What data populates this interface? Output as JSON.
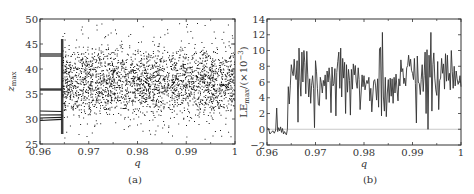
{
  "chart_data": [
    {
      "id": "a",
      "type": "scatter",
      "caption": "(a)",
      "title": "",
      "xlabel": "q",
      "ylabel": "z_max",
      "ylabel_main": "z",
      "ylabel_sub": "max",
      "xlim": [
        0.96,
        1.0
      ],
      "ylim": [
        25,
        50
      ],
      "xticks": [
        0.96,
        0.97,
        0.98,
        0.99,
        1.0
      ],
      "xtick_labels": [
        "0.96",
        "0.97",
        "0.98",
        "0.99",
        "1"
      ],
      "yticks": [
        25,
        30,
        35,
        40,
        45,
        50
      ],
      "ytick_labels": [
        "25",
        "30",
        "35",
        "40",
        "45",
        "50"
      ],
      "grid": false,
      "legend": null,
      "periodic_branches": {
        "x_range": [
          0.96,
          0.9645
        ],
        "z_values": [
          43.0,
          42.6,
          36.0,
          35.8,
          31.6,
          30.8,
          30.2,
          29.7
        ]
      },
      "chaotic_region": {
        "x_range": [
          0.9645,
          1.0
        ],
        "z_center": 37.5,
        "z_spread_core": [
          30,
          44
        ],
        "z_extremes": [
          26,
          49.5
        ],
        "point_count": 6000,
        "marker_color": "#1a1a1a"
      }
    },
    {
      "id": "b",
      "type": "line",
      "caption": "(b)",
      "title": "",
      "xlabel": "q",
      "ylabel": "LE_max/(×10^-3)",
      "ylabel_main": "LE",
      "ylabel_sub": "max",
      "ylabel_suffix": "/(×10",
      "ylabel_exp": "−3",
      "ylabel_close": ")",
      "xlim": [
        0.96,
        1.0
      ],
      "ylim": [
        -2,
        14
      ],
      "xticks": [
        0.96,
        0.97,
        0.98,
        0.99,
        1.0
      ],
      "xtick_labels": [
        "0.96",
        "0.97",
        "0.98",
        "0.99",
        "1"
      ],
      "yticks": [
        -2,
        0,
        2,
        4,
        6,
        8,
        10,
        12,
        14
      ],
      "ytick_labels": [
        "−2",
        "0",
        "2",
        "4",
        "6",
        "8",
        "10",
        "12",
        "14"
      ],
      "grid": false,
      "legend": null,
      "reference_line": {
        "y": 0,
        "color": "#bbbbbb"
      },
      "line_color": "#333333",
      "x": [
        0.96,
        0.9603,
        0.9606,
        0.9609,
        0.9612,
        0.9615,
        0.9618,
        0.962,
        0.9622,
        0.9624,
        0.9626,
        0.9628,
        0.963,
        0.9632,
        0.9634,
        0.9636,
        0.9638,
        0.964,
        0.9642,
        0.9644,
        0.9646,
        0.9648,
        0.965,
        0.9652,
        0.9654,
        0.9656,
        0.9658,
        0.966,
        0.9662,
        0.9664,
        0.9666,
        0.9668,
        0.967,
        0.9672,
        0.9674,
        0.9676,
        0.9678,
        0.968,
        0.9682,
        0.9684,
        0.9686,
        0.9688,
        0.969,
        0.9692,
        0.9694,
        0.9696,
        0.9698,
        0.97,
        0.9702,
        0.9704,
        0.9706,
        0.9708,
        0.971,
        0.9712,
        0.9714,
        0.9716,
        0.9718,
        0.972,
        0.9722,
        0.9724,
        0.9726,
        0.9728,
        0.973,
        0.9732,
        0.9734,
        0.9736,
        0.9738,
        0.974,
        0.9742,
        0.9744,
        0.9746,
        0.9748,
        0.975,
        0.9752,
        0.9754,
        0.9756,
        0.9758,
        0.976,
        0.9762,
        0.9764,
        0.9766,
        0.9768,
        0.977,
        0.9772,
        0.9774,
        0.9776,
        0.9778,
        0.978,
        0.9782,
        0.9784,
        0.9786,
        0.9788,
        0.979,
        0.9792,
        0.9794,
        0.9796,
        0.9798,
        0.98,
        0.9802,
        0.9804,
        0.9806,
        0.9808,
        0.981,
        0.9812,
        0.9814,
        0.9816,
        0.9818,
        0.982,
        0.9822,
        0.9824,
        0.9826,
        0.9828,
        0.983,
        0.9832,
        0.9834,
        0.9836,
        0.9838,
        0.984,
        0.9842,
        0.9844,
        0.9846,
        0.9848,
        0.985,
        0.9852,
        0.9854,
        0.9856,
        0.9858,
        0.986,
        0.9862,
        0.9864,
        0.9866,
        0.9868,
        0.987,
        0.9872,
        0.9874,
        0.9876,
        0.9878,
        0.988,
        0.9882,
        0.9884,
        0.9886,
        0.9888,
        0.989,
        0.9892,
        0.9894,
        0.9896,
        0.9898,
        0.99,
        0.9902,
        0.9904,
        0.9906,
        0.9908,
        0.991,
        0.9912,
        0.9914,
        0.9916,
        0.9918,
        0.992,
        0.9922,
        0.9924,
        0.9926,
        0.9928,
        0.993,
        0.9932,
        0.9934,
        0.9936,
        0.9938,
        0.994,
        0.9942,
        0.9944,
        0.9946,
        0.9948,
        0.995,
        0.9952,
        0.9954,
        0.9956,
        0.9958,
        0.996,
        0.9962,
        0.9964,
        0.9966,
        0.9968,
        0.997,
        0.9972,
        0.9974,
        0.9976,
        0.9978,
        0.998,
        0.9982,
        0.9984,
        0.9986,
        0.9988,
        0.999,
        0.9992,
        0.9994,
        0.9996,
        0.9998,
        1.0
      ],
      "y": [
        0.2,
        0.1,
        -0.6,
        -0.4,
        -0.2,
        -0.5,
        -0.1,
        2.7,
        -0.3,
        0.2,
        -0.2,
        0.3,
        -0.4,
        0.1,
        -0.6,
        -0.3,
        -0.5,
        -0.7,
        0.0,
        5.4,
        3.2,
        5.5,
        8.2,
        7.4,
        6.8,
        8.9,
        7.0,
        6.3,
        8.7,
        0.9,
        10.3,
        6.1,
        4.2,
        9.8,
        6.0,
        10.0,
        8.5,
        4.5,
        9.9,
        7.0,
        4.1,
        6.4,
        3.3,
        5.6,
        6.8,
        5.2,
        0.2,
        8.7,
        7.3,
        5.2,
        3.1,
        3.0,
        6.6,
        5.9,
        4.6,
        6.2,
        5.5,
        6.9,
        3.8,
        7.4,
        6.0,
        7.8,
        6.2,
        2.1,
        7.9,
        5.5,
        5.8,
        7.7,
        1.7,
        7.2,
        8.6,
        9.8,
        5.2,
        10.3,
        4.1,
        9.0,
        6.5,
        8.5,
        2.0,
        8.2,
        4.7,
        7.6,
        6.2,
        1.8,
        7.6,
        5.1,
        8.3,
        6.9,
        8.1,
        6.0,
        5.2,
        7.8,
        6.3,
        2.5,
        4.6,
        6.9,
        5.4,
        6.8,
        5.0,
        5.7,
        6.2,
        5.8,
        6.6,
        3.6,
        5.2,
        2.2,
        4.1,
        6.1,
        6.3,
        5.5,
        3.7,
        6.4,
        2.8,
        10.2,
        10.4,
        1.7,
        12.3,
        4.1,
        2.3,
        6.6,
        1.6,
        4.6,
        6.3,
        3.4,
        6.5,
        4.2,
        6.4,
        3.3,
        6.6,
        4.6,
        7.0,
        5.1,
        3.6,
        6.4,
        5.5,
        8.8,
        7.3,
        7.7,
        5.8,
        6.5,
        5.5,
        7.8,
        8.1,
        9.4,
        8.0,
        8.9,
        7.5,
        7.1,
        6.3,
        9.0,
        5.8,
        0.8,
        9.3,
        6.0,
        5.8,
        4.4,
        6.3,
        8.2,
        4.8,
        6.8,
        9.8,
        2.0,
        10.1,
        0.0,
        9.4,
        6.6,
        12.3,
        2.3,
        8.2,
        9.7,
        6.5,
        5.0,
        4.3,
        8.6,
        2.5,
        6.2,
        6.5,
        9.0,
        7.1,
        8.3,
        5.1,
        9.6,
        6.1,
        9.4,
        6.2,
        7.1,
        5.0,
        10.0,
        7.3,
        5.2,
        8.0,
        5.5,
        7.4,
        6.4,
        5.7,
        6.0,
        6.8,
        5.4,
        6.2,
        5.8,
        6.0
      ]
    }
  ]
}
